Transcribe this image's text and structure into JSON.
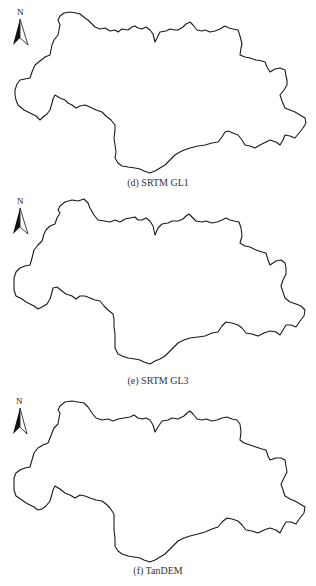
{
  "figure": {
    "panels": [
      {
        "id": "d",
        "caption": "(d) SRTM GL1",
        "north_label": "N"
      },
      {
        "id": "e",
        "caption": "(e) SRTM GL3",
        "north_label": "N"
      },
      {
        "id": "f",
        "caption": "(f) TanDEM",
        "north_label": "N"
      }
    ],
    "colors": {
      "outline": "#1a1a1a",
      "background": "#ffffff",
      "arrow_fill": "#111111"
    }
  }
}
